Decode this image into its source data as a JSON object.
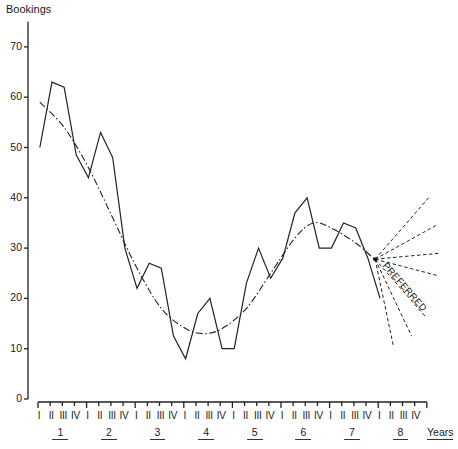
{
  "chart_data": {
    "type": "line",
    "title": "",
    "ylabel": "Bookings",
    "xlabel": "Years",
    "ylim": [
      0,
      75
    ],
    "yticks": [
      0,
      10,
      20,
      30,
      40,
      50,
      60,
      70
    ],
    "grid": false,
    "quarter_labels": [
      "I",
      "II",
      "III",
      "IV"
    ],
    "year_labels": [
      "1",
      "2",
      "3",
      "4",
      "5",
      "6",
      "7",
      "8"
    ],
    "x_end_label": "Years",
    "series": [
      {
        "name": "Quarterly bookings (actual)",
        "style": "solid",
        "x": [
          1,
          2,
          3,
          4,
          5,
          6,
          7,
          8,
          9,
          10,
          11,
          12,
          13,
          14,
          15,
          16,
          17,
          18,
          19,
          20,
          21,
          22,
          23,
          24,
          25,
          26,
          27,
          28,
          29
        ],
        "values": [
          50,
          63,
          62,
          48.5,
          44,
          53,
          48,
          30,
          22,
          27,
          26,
          12.5,
          8,
          17,
          20,
          10,
          10,
          23,
          30,
          24,
          28,
          37,
          40,
          30,
          30,
          35,
          34,
          28,
          20
        ]
      },
      {
        "name": "Trend",
        "style": "dash-dot",
        "x": [
          1,
          3,
          5,
          7,
          9,
          11,
          13,
          14.5,
          16,
          18,
          20,
          22,
          23.5,
          25,
          27,
          28.6
        ],
        "values": [
          59,
          54,
          46,
          36,
          26,
          18,
          14,
          13,
          14,
          18,
          25,
          32,
          35,
          34,
          31,
          27.7
        ]
      }
    ],
    "forecast_fan": {
      "origin": {
        "x": 28.6,
        "value": 27.8
      },
      "style": "dashed",
      "lines": [
        {
          "x": 33,
          "value": 40
        },
        {
          "x": 33.6,
          "value": 34.5
        },
        {
          "x": 34,
          "value": 29
        },
        {
          "x": 33.8,
          "value": 24.5
        },
        {
          "x": 32.7,
          "value": 16.5,
          "label": "PREFERRED"
        },
        {
          "x": 31.6,
          "value": 12.5
        },
        {
          "x": 30.1,
          "value": 10.5
        }
      ]
    },
    "annotations": [
      "PREFERRED"
    ]
  }
}
